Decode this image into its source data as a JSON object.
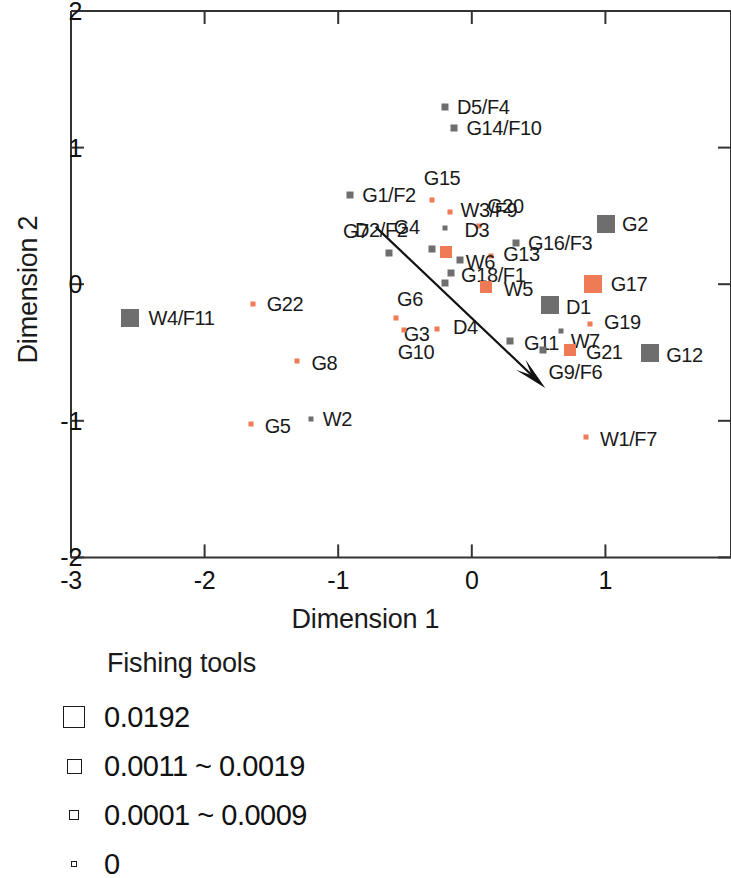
{
  "chart_data": {
    "type": "scatter",
    "title": "",
    "xlabel": "Dimension 1",
    "ylabel": "Dimension 2",
    "xlim": [
      -3,
      2
    ],
    "ylim": [
      -2,
      2
    ],
    "xticks": [
      "-3",
      "-2",
      "-1",
      "0",
      "1",
      "2"
    ],
    "xtick_values": [
      -3,
      -2,
      -1,
      0,
      1,
      2
    ],
    "yticks": [
      "-2",
      "-1",
      "0",
      "1",
      "2"
    ],
    "ytick_values": [
      -2,
      -1,
      0,
      1,
      2
    ],
    "grid": false,
    "legend_position": "below-plot",
    "annotation_arrow": {
      "from": [
        -0.72,
        0.42
      ],
      "to": [
        0.55,
        -0.76
      ]
    },
    "marker_sizes": {
      "large": 18,
      "medium": 12,
      "small": 7,
      "tiny": 5
    },
    "colors": {
      "orange": "#EE7A56",
      "gray": "#6E6E6E",
      "axis": "#333333",
      "text": "#1a1a1a"
    },
    "points": [
      {
        "label": "D5/F4",
        "x": -0.2,
        "y": 1.295,
        "color": "gray",
        "size": "small",
        "lx": 12,
        "ly": 0
      },
      {
        "label": "G14/F10",
        "x": -0.13,
        "y": 1.145,
        "color": "gray",
        "size": "small",
        "lx": 12,
        "ly": 0
      },
      {
        "label": "G1/F2",
        "x": -0.91,
        "y": 0.655,
        "color": "gray",
        "size": "small",
        "lx": 12,
        "ly": 0
      },
      {
        "label": "G15",
        "x": -0.3,
        "y": 0.615,
        "color": "orange",
        "size": "tiny",
        "lx": -8,
        "ly": -22
      },
      {
        "label": "W3/F9",
        "x": -0.16,
        "y": 0.525,
        "color": "orange",
        "size": "tiny",
        "lx": 10,
        "ly": -2
      },
      {
        "label": "G20",
        "x": 0.055,
        "y": 0.425,
        "color": "orange",
        "size": "tiny",
        "lx": 8,
        "ly": -20
      },
      {
        "label": "D2/F2",
        "x": -0.2,
        "y": 0.415,
        "color": "gray",
        "size": "tiny",
        "lx": -90,
        "ly": 2
      },
      {
        "label": "G2",
        "x": 1.005,
        "y": 0.44,
        "color": "gray",
        "size": "large",
        "lx": 16,
        "ly": 0
      },
      {
        "label": "G16/F3",
        "x": 0.33,
        "y": 0.305,
        "color": "gray",
        "size": "small",
        "lx": 12,
        "ly": 0
      },
      {
        "label": "G7",
        "x": -0.62,
        "y": 0.23,
        "color": "gray",
        "size": "small",
        "lx": -46,
        "ly": -22
      },
      {
        "label": "G4",
        "x": -0.3,
        "y": 0.255,
        "color": "gray",
        "size": "small",
        "lx": -38,
        "ly": -22
      },
      {
        "label": "D3",
        "x": -0.19,
        "y": 0.235,
        "color": "orange",
        "size": "medium",
        "lx": 18,
        "ly": -22
      },
      {
        "label": "G13",
        "x": 0.145,
        "y": 0.205,
        "color": "orange",
        "size": "tiny",
        "lx": 12,
        "ly": -2
      },
      {
        "label": "W6",
        "x": -0.09,
        "y": 0.175,
        "color": "gray",
        "size": "small",
        "lx": 6,
        "ly": 2
      },
      {
        "label": "G18/F1",
        "x": -0.155,
        "y": 0.085,
        "color": "gray",
        "size": "small",
        "lx": 10,
        "ly": 2
      },
      {
        "label": "G6",
        "x": -0.2,
        "y": 0.01,
        "color": "gray",
        "size": "small",
        "lx": -48,
        "ly": 16
      },
      {
        "label": "W5",
        "x": 0.105,
        "y": -0.02,
        "color": "orange",
        "size": "medium",
        "lx": 18,
        "ly": 2
      },
      {
        "label": "G17",
        "x": 0.905,
        "y": 0.0,
        "color": "orange",
        "size": "large",
        "lx": 18,
        "ly": 0
      },
      {
        "label": "D1",
        "x": 0.585,
        "y": -0.155,
        "color": "gray",
        "size": "large",
        "lx": 16,
        "ly": 2
      },
      {
        "label": "G22",
        "x": -1.64,
        "y": -0.145,
        "color": "orange",
        "size": "tiny",
        "lx": 14,
        "ly": 0
      },
      {
        "label": "W4/F11",
        "x": -2.555,
        "y": -0.245,
        "color": "gray",
        "size": "large",
        "lx": 18,
        "ly": 0
      },
      {
        "label": "G3",
        "x": -0.57,
        "y": -0.245,
        "color": "orange",
        "size": "tiny",
        "lx": 8,
        "ly": 16
      },
      {
        "label": "G19",
        "x": 0.885,
        "y": -0.29,
        "color": "orange",
        "size": "tiny",
        "lx": 14,
        "ly": -2
      },
      {
        "label": "D4",
        "x": -0.26,
        "y": -0.325,
        "color": "orange",
        "size": "tiny",
        "lx": 16,
        "ly": -2
      },
      {
        "label": "W7",
        "x": 0.665,
        "y": -0.345,
        "color": "gray",
        "size": "tiny",
        "lx": 10,
        "ly": 10
      },
      {
        "label": "G10",
        "x": -0.51,
        "y": -0.335,
        "color": "orange",
        "size": "tiny",
        "lx": -6,
        "ly": 22
      },
      {
        "label": "G11",
        "x": 0.285,
        "y": -0.415,
        "color": "gray",
        "size": "small",
        "lx": 14,
        "ly": 2
      },
      {
        "label": "G21",
        "x": 0.735,
        "y": -0.485,
        "color": "orange",
        "size": "medium",
        "lx": 16,
        "ly": 2
      },
      {
        "label": "G12",
        "x": 1.335,
        "y": -0.505,
        "color": "gray",
        "size": "large",
        "lx": 16,
        "ly": 2
      },
      {
        "label": "G8",
        "x": -1.305,
        "y": -0.565,
        "color": "orange",
        "size": "tiny",
        "lx": 14,
        "ly": 2
      },
      {
        "label": "G9/F6",
        "x": 0.53,
        "y": -0.485,
        "color": "gray",
        "size": "small",
        "lx": 6,
        "ly": 22
      },
      {
        "label": "G5",
        "x": -1.655,
        "y": -1.025,
        "color": "orange",
        "size": "tiny",
        "lx": 14,
        "ly": 2
      },
      {
        "label": "W2",
        "x": -1.205,
        "y": -0.985,
        "color": "gray",
        "size": "tiny",
        "lx": 12,
        "ly": 0
      },
      {
        "label": "W1/F7",
        "x": 0.855,
        "y": -1.115,
        "color": "orange",
        "size": "tiny",
        "lx": 14,
        "ly": 2
      }
    ]
  },
  "legend": {
    "title": "Fishing tools",
    "entries": [
      {
        "label": "0.0192",
        "swatch": 22
      },
      {
        "label": "0.0011 ~ 0.0019",
        "swatch": 15
      },
      {
        "label": "0.0001 ~ 0.0009",
        "swatch": 10
      },
      {
        "label": "0",
        "swatch": 6
      }
    ]
  }
}
